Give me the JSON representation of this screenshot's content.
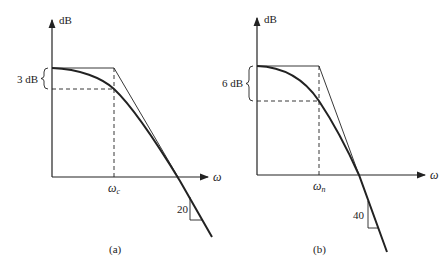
{
  "panels": [
    {
      "id": "a",
      "caption": "(a)",
      "y_axis_label": "dB",
      "x_axis_label": "ω",
      "corner_label_main": "ω",
      "corner_label_sub": "c",
      "drop_label": "3 dB",
      "slope_label": "20"
    },
    {
      "id": "b",
      "caption": "(b)",
      "y_axis_label": "dB",
      "x_axis_label": "ω",
      "corner_label_main": "ω",
      "corner_label_sub": "n",
      "drop_label": "6 dB",
      "slope_label": "40"
    }
  ],
  "colors": {
    "ink": "#222222",
    "background": "#ffffff"
  }
}
